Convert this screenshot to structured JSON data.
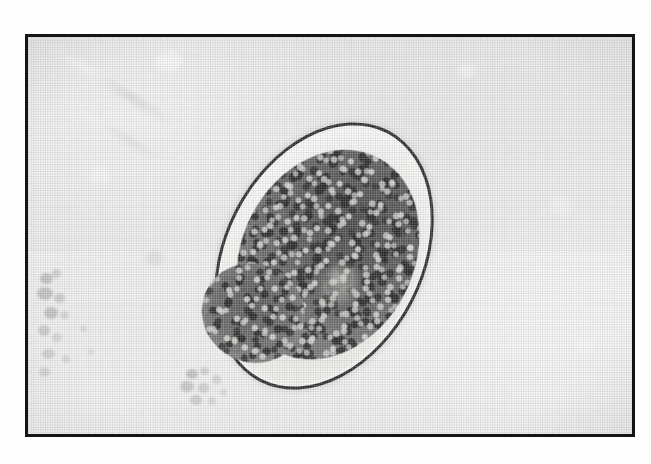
{
  "figure": {
    "caption": "",
    "frame": {
      "border_color": "#151515",
      "border_width_px": 3,
      "left_px": 25,
      "top_px": 34,
      "width_px": 610,
      "height_px": 403
    },
    "medium": "halftone-printed light microscopy photomicrograph",
    "background_color": "#eaeaea"
  },
  "specimen": {
    "name": "helminth-ovum",
    "description": "Ellipsoidal thin-shelled egg containing a dark granular embryo with a single large blastomere lobe at the lower left",
    "orientation_degrees": 27,
    "shell": {
      "label": "egg-shell",
      "color": "#1b1b1b",
      "thickness_px": 3,
      "fill_color": "#f4f4f2"
    },
    "perivitelline_space": {
      "label": "perivitelline-space",
      "color": "#fafaf8"
    },
    "embryo": {
      "label": "embryo-morula",
      "color": "#4a4a4a",
      "texture": "coarse granular"
    },
    "blastomere": {
      "label": "blastomere-lobe",
      "color": "#5a5a5a",
      "texture": "coarse granular"
    }
  },
  "artifacts": {
    "debris_left": {
      "label": "debris-cluster-left",
      "color": "#787878"
    },
    "debris_center": {
      "label": "debris-cluster-center",
      "color": "#808080"
    },
    "tone_band": {
      "label": "scan-tone-band",
      "color": "#f4f4f4"
    },
    "bleed_marks": [
      "·",
      "·",
      "·"
    ]
  }
}
